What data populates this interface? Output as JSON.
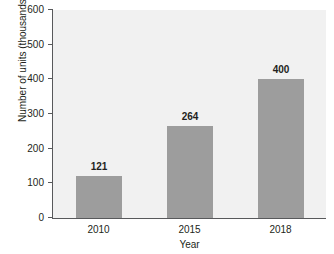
{
  "chart_data": {
    "type": "bar",
    "title": "",
    "subtitle": "",
    "xlabel": "Year",
    "ylabel": "Number of units (thousands)",
    "categories": [
      "2010",
      "2015",
      "2018"
    ],
    "values": [
      121,
      264,
      400
    ],
    "value_labels": [
      "121",
      "264",
      "400"
    ],
    "ylim": [
      0,
      600
    ],
    "yticks": [
      0,
      100,
      200,
      300,
      400,
      500,
      600
    ],
    "ytick_labels": [
      "0",
      "100",
      "200",
      "300",
      "400",
      "500",
      "600"
    ],
    "grid": false,
    "legend": false,
    "legend_position": "none",
    "series": [
      {
        "name": "Number of units (thousands)",
        "values": [
          121,
          264,
          400
        ]
      }
    ],
    "colors": {
      "bar": "#9d9d9d",
      "plot_background": "#f1f1f1",
      "page_background": "#ffffff",
      "axis": "#58595b",
      "text": "#231f20"
    }
  }
}
